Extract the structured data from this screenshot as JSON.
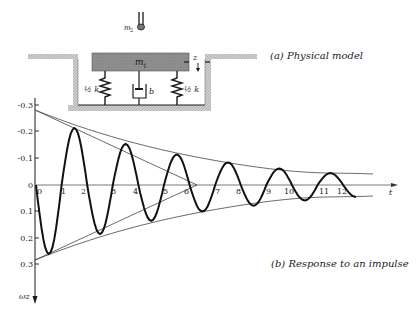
{
  "figure": {
    "caption_a": "(a)  Physical model",
    "caption_b": "(b)  Response to an impulse",
    "model": {
      "mass1_label": "m",
      "mass1_sub": "1",
      "mass2_label": "m",
      "mass2_sub": "2",
      "spring_left_label": "½ k",
      "spring_right_label": "½ k",
      "damper_label": "b",
      "displacement_label": "z"
    },
    "axes": {
      "x_label": "t",
      "y_label": "ωz"
    },
    "colors": {
      "ink": "#1a1a1a",
      "mass_fill": "#8c8c8c",
      "wall_fill": "#c8c8c8",
      "envelope": "#444444"
    }
  },
  "chart_data": {
    "type": "line",
    "title": "Response to an impulse",
    "xlabel": "t",
    "ylabel": "ωz",
    "y_axis_inverted": true,
    "ylim": [
      -0.3,
      0.3
    ],
    "yticks": [
      "-0.3",
      "-0.2",
      "-0.1",
      "0",
      "0.1",
      "0.2",
      "0.3"
    ],
    "x_marks": [
      "0",
      "1",
      "2",
      "3",
      "4",
      "5",
      "6",
      "7",
      "8",
      "9",
      "10",
      "11",
      "12"
    ],
    "x_marks_note": "marks label successive zero-crossings of the response",
    "series": [
      {
        "name": "impulse response (damped oscillation)",
        "extrema": [
          {
            "crossing_after": 0,
            "value": 0.26
          },
          {
            "crossing_after": 1,
            "value": -0.215
          },
          {
            "crossing_after": 2,
            "value": 0.185
          },
          {
            "crossing_after": 3,
            "value": -0.155
          },
          {
            "crossing_after": 4,
            "value": 0.135
          },
          {
            "crossing_after": 5,
            "value": -0.115
          },
          {
            "crossing_after": 6,
            "value": 0.1
          },
          {
            "crossing_after": 7,
            "value": -0.085
          },
          {
            "crossing_after": 8,
            "value": 0.078
          },
          {
            "crossing_after": 9,
            "value": -0.062
          },
          {
            "crossing_after": 10,
            "value": 0.058
          },
          {
            "crossing_after": 11,
            "value": -0.045
          },
          {
            "crossing_after": 12,
            "value": 0.045
          }
        ]
      },
      {
        "name": "upper exponential envelope",
        "start": -0.28,
        "end": -0.04
      },
      {
        "name": "lower exponential envelope",
        "start": 0.28,
        "end": 0.04
      },
      {
        "name": "initial tangent lines",
        "converge_at_crossing": 6.3
      }
    ]
  }
}
